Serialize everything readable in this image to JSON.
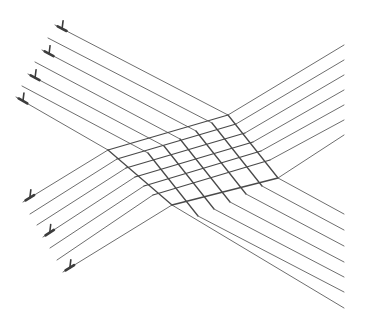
{
  "diagram": {
    "colors": {
      "background": "#ffffff",
      "line": "#6e6e6e",
      "grid_line": "#4a4a4a",
      "marker": "#3c3c3c"
    },
    "family_a": {
      "name": "descending-lines",
      "lines": [
        {
          "points": [
            [
              55,
              25
            ],
            [
              228,
              115
            ],
            [
              278,
              178
            ],
            [
              344,
              214
            ]
          ],
          "marker": true
        },
        {
          "points": [
            [
              48,
              38
            ],
            [
              212,
              123
            ],
            [
              262,
              186
            ],
            [
              344,
              230
            ]
          ],
          "marker": false
        },
        {
          "points": [
            [
              42,
              50
            ],
            [
              196,
              131
            ],
            [
              246,
              194
            ],
            [
              344,
              246
            ]
          ],
          "marker": true
        },
        {
          "points": [
            [
              35,
              62
            ],
            [
              180,
              139
            ],
            [
              230,
              202
            ],
            [
              344,
              262
            ]
          ],
          "marker": false
        },
        {
          "points": [
            [
              28,
              74
            ],
            [
              164,
              146
            ],
            [
              214,
              209
            ],
            [
              344,
              277
            ]
          ],
          "marker": true
        },
        {
          "points": [
            [
              22,
              86
            ],
            [
              148,
              153
            ],
            [
              198,
              216
            ],
            [
              344,
              292
            ]
          ],
          "marker": false
        },
        {
          "points": [
            [
              16,
              97
            ],
            [
              108,
              150
            ],
            [
              172,
              205
            ],
            [
              344,
              308
            ]
          ],
          "marker": true
        }
      ]
    },
    "family_b": {
      "name": "ascending-lines",
      "lines": [
        {
          "points": [
            [
              23,
              202
            ],
            [
              108,
              150
            ],
            [
              228,
              115
            ],
            [
              344,
              45
            ]
          ],
          "marker": true
        },
        {
          "points": [
            [
              30,
              214
            ],
            [
              117,
              159
            ],
            [
              236,
              124
            ],
            [
              344,
              60
            ]
          ],
          "marker": false
        },
        {
          "points": [
            [
              37,
              225
            ],
            [
              126,
              168
            ],
            [
              245,
              133
            ],
            [
              344,
              75
            ]
          ],
          "marker": false
        },
        {
          "points": [
            [
              43,
              237
            ],
            [
              135,
              177
            ],
            [
              253,
              142
            ],
            [
              344,
              90
            ]
          ],
          "marker": true
        },
        {
          "points": [
            [
              50,
              248
            ],
            [
              144,
              186
            ],
            [
              261,
              151
            ],
            [
              344,
              105
            ]
          ],
          "marker": false
        },
        {
          "points": [
            [
              57,
              260
            ],
            [
              153,
              195
            ],
            [
              270,
              160
            ],
            [
              344,
              120
            ]
          ],
          "marker": false
        },
        {
          "points": [
            [
              63,
              272
            ],
            [
              172,
              205
            ],
            [
              278,
              178
            ],
            [
              344,
              135
            ]
          ],
          "marker": true
        }
      ]
    },
    "grid_region": {
      "corners": [
        [
          108,
          150
        ],
        [
          228,
          115
        ],
        [
          278,
          178
        ],
        [
          172,
          205
        ]
      ]
    }
  }
}
